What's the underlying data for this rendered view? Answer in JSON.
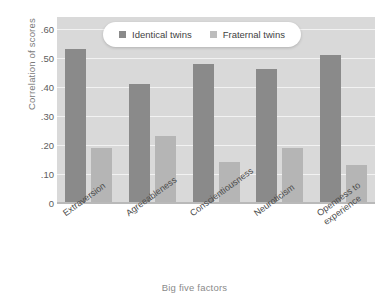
{
  "chart_data": {
    "type": "bar",
    "title": "",
    "xlabel": "Big five factors",
    "ylabel": "Correlation of scores",
    "categories": [
      "Extraversion",
      "Agreeableness",
      "Conscientiousness",
      "Neuroticism",
      "Openness to experience"
    ],
    "category_lines": [
      [
        "Extraversion"
      ],
      [
        "Agreeableness"
      ],
      [
        "Conscientiousness"
      ],
      [
        "Neuroticism"
      ],
      [
        "Openness to",
        "experience"
      ]
    ],
    "series": [
      {
        "name": "Identical twins",
        "color": "#8a8a8a",
        "values": [
          0.53,
          0.41,
          0.48,
          0.46,
          0.51
        ]
      },
      {
        "name": "Fraternal twins",
        "color": "#b5b5b5",
        "values": [
          0.19,
          0.23,
          0.14,
          0.19,
          0.13
        ]
      }
    ],
    "ylim": [
      0,
      0.64
    ],
    "yticks": [
      0,
      0.1,
      0.2,
      0.3,
      0.4,
      0.5,
      0.6
    ],
    "ytick_labels": [
      "0",
      ".10",
      ".20",
      ".30",
      ".40",
      ".50",
      ".60"
    ],
    "grid": true,
    "legend_position": "top-center",
    "plot_background": "#d9d9d9",
    "gridline_color": "#f2f2f2"
  }
}
